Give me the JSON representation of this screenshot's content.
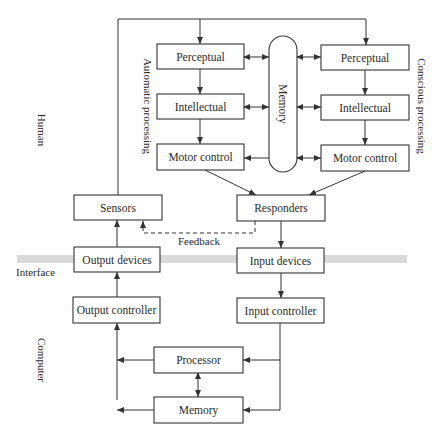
{
  "diagram": {
    "regions": {
      "human": "Human",
      "interface": "Interface",
      "computer": "Computer"
    },
    "side_labels": {
      "automatic": "Automatic processing",
      "conscious": "Conscious processing"
    },
    "human_automatic": {
      "perceptual": "Perceptual",
      "intellectual": "Intellectual",
      "motor": "Motor control"
    },
    "human_conscious": {
      "perceptual": "Perceptual",
      "intellectual": "Intellectual",
      "motor": "Motor control"
    },
    "human_memory": "Memory",
    "sensors": "Sensors",
    "responders": "Responders",
    "feedback": "Feedback",
    "output_devices": "Output devices",
    "input_devices": "Input devices",
    "output_controller": "Output controller",
    "input_controller": "Input controller",
    "processor": "Processor",
    "computer_memory": "Memory",
    "colors": {
      "line": "#333333",
      "interface_band": "#d9d9d9",
      "background": "#ffffff"
    }
  }
}
